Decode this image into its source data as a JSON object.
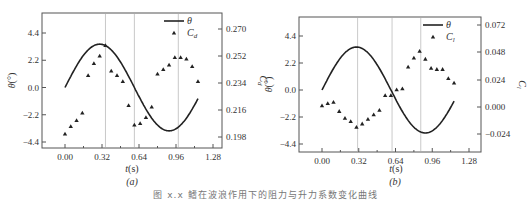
{
  "caption": "图 x.x  鳍在波浪作用下的阻力与升力系数变化曲线",
  "chart_data": [
    {
      "panel": "(a)",
      "type": "scatter+line",
      "title": "",
      "xlabel": "t(s)",
      "ylabel_left": "θ(°)",
      "ylabel_right": "Cd",
      "x_ticks": [
        "0.00",
        "0.32",
        "0.64",
        "0.96",
        "1.28"
      ],
      "xlim": [
        -0.2,
        1.42
      ],
      "y_left_ticks": [
        "4.4",
        "2.2",
        "0.0",
        "-2.2",
        "-4.4"
      ],
      "ylim_left": [
        -4.8,
        6.0
      ],
      "y_right_ticks": [
        "0.270",
        "0.252",
        "0.234",
        "0.216",
        "0.198"
      ],
      "ylim_right": [
        0.193,
        0.28
      ],
      "grid": false,
      "legend": {
        "position": "upper right",
        "entries": [
          "θ",
          "Cd"
        ]
      },
      "vlines": [
        0.35,
        0.6,
        0.98
      ],
      "series": [
        {
          "name": "θ",
          "kind": "line",
          "axis": "left",
          "amplitude": 3.5,
          "period": 1.2,
          "x_range": [
            0.0,
            1.15
          ]
        },
        {
          "name": "Cd",
          "kind": "scatter",
          "marker": "triangle",
          "axis": "right",
          "x": [
            0.0,
            0.05,
            0.1,
            0.15,
            0.2,
            0.25,
            0.3,
            0.35,
            0.4,
            0.45,
            0.5,
            0.55,
            0.6,
            0.65,
            0.7,
            0.75,
            0.8,
            0.85,
            0.9,
            0.95,
            1.0,
            1.05,
            1.1,
            1.15
          ],
          "values": [
            0.2,
            0.205,
            0.209,
            0.214,
            0.239,
            0.247,
            0.252,
            0.259,
            0.242,
            0.239,
            0.235,
            0.219,
            0.206,
            0.207,
            0.211,
            0.218,
            0.24,
            0.243,
            0.246,
            0.251,
            0.251,
            0.25,
            0.245,
            0.235
          ]
        }
      ]
    },
    {
      "panel": "(b)",
      "type": "scatter+line",
      "title": "",
      "xlabel": "t(s)",
      "ylabel_left": "θ(°)",
      "ylabel_right": "Cl",
      "x_ticks": [
        "0.00",
        "0.32",
        "0.64",
        "0.96",
        "1.28"
      ],
      "xlim": [
        -0.2,
        1.42
      ],
      "y_left_ticks": [
        "4.4",
        "2.2",
        "0.0",
        "-2.2",
        "-4.4"
      ],
      "ylim_left": [
        -4.8,
        6.0
      ],
      "y_right_ticks": [
        "0.072",
        "0.048",
        "0.024",
        "0.000",
        "-0.024"
      ],
      "ylim_right": [
        -0.041,
        0.081
      ],
      "grid": false,
      "legend": {
        "position": "upper right",
        "entries": [
          "θ",
          "Cl"
        ]
      },
      "vlines": [
        0.31,
        0.61,
        0.86
      ],
      "series": [
        {
          "name": "θ",
          "kind": "line",
          "axis": "left",
          "amplitude": 3.5,
          "period": 1.2,
          "x_range": [
            0.0,
            1.15
          ]
        },
        {
          "name": "Cl",
          "kind": "scatter",
          "marker": "triangle",
          "axis": "right",
          "x": [
            0.0,
            0.05,
            0.1,
            0.15,
            0.2,
            0.25,
            0.3,
            0.35,
            0.4,
            0.45,
            0.5,
            0.55,
            0.6,
            0.65,
            0.7,
            0.75,
            0.8,
            0.85,
            0.9,
            0.95,
            1.0,
            1.05,
            1.1,
            1.15
          ],
          "values": [
            0.001,
            0.003,
            0.004,
            -0.004,
            -0.01,
            -0.013,
            -0.018,
            -0.015,
            -0.011,
            -0.007,
            -0.003,
            0.01,
            0.01,
            0.015,
            0.016,
            0.035,
            0.043,
            0.049,
            0.042,
            0.034,
            0.033,
            0.033,
            0.025,
            0.021
          ]
        }
      ]
    }
  ],
  "panels": [
    {
      "sublabel": "(a)",
      "xlabel": "t(s)",
      "ylabel_left": "θ(°)",
      "ylabel_right_main": "C",
      "ylabel_right_sub": "d",
      "legend_line": "θ",
      "legend_marker_main": "C",
      "legend_marker_sub": "d"
    },
    {
      "sublabel": "(b)",
      "xlabel": "t(s)",
      "ylabel_left": "θ(°)",
      "ylabel_right_main": "C",
      "ylabel_right_sub": "l",
      "legend_line": "θ",
      "legend_marker_main": "C",
      "legend_marker_sub": "l"
    }
  ]
}
